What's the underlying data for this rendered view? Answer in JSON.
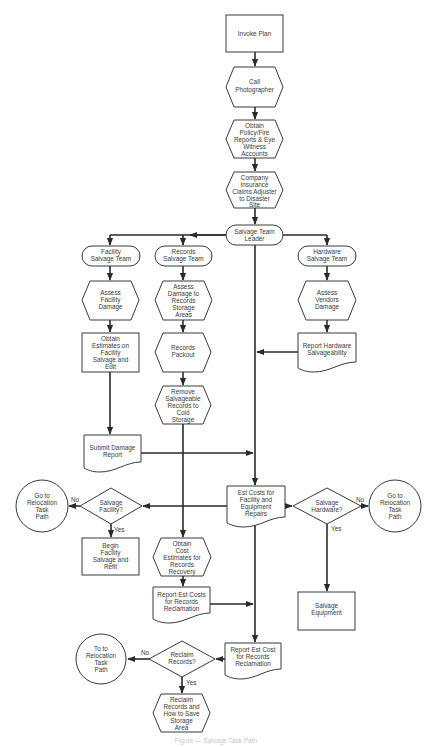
{
  "diagram": {
    "caption": "Figure — Salvage Task Path",
    "nodes": {
      "invoke_plan": [
        "Invoke Plan"
      ],
      "call_photographer": [
        "Call",
        "Photographer"
      ],
      "obtain_policy": [
        "Obtain",
        "Policy/Fire",
        "Reports & Eye",
        "Witness",
        "Accounts"
      ],
      "company_insurance": [
        "Company",
        "Insurance",
        "Claims Adjuster",
        "to Disaster",
        "Site"
      ],
      "salvage_team_leader": [
        "Salvage Team",
        "Leader"
      ],
      "facility_salvage_team": [
        "Facility",
        "Salvage Team"
      ],
      "records_salvage_team": [
        "Records",
        "Salvage Team"
      ],
      "hardware_salvage_team": [
        "Hardware",
        "Salvage Team"
      ],
      "assess_facility_damage": [
        "Assess",
        "Facility",
        "Damage"
      ],
      "assess_records_damage": [
        "Assess",
        "Damage to",
        "Records",
        "Storage",
        "Areas"
      ],
      "assess_vendors_damage": [
        "Assess",
        "Vendors",
        "Damage"
      ],
      "obtain_estimates_facility": [
        "Obtain",
        "Estimates on",
        "Facility",
        "Salvage and",
        "Edit"
      ],
      "records_packout": [
        "Records",
        "Packout"
      ],
      "report_hardware_salvageability": [
        "Report Hardware",
        "Salvageability"
      ],
      "remove_salvageable_records": [
        "Remove",
        "Salvageable",
        "Records to",
        "Cold",
        "Storage"
      ],
      "submit_damage_report": [
        "Submit Damage",
        "Report"
      ],
      "est_costs_facility_equipment": [
        "Est Costs for",
        "Facility and",
        "Equipment",
        "Repairs"
      ],
      "salvage_facility_decision": [
        "Salvage",
        "Facility?"
      ],
      "goto_relocation_left": [
        "Go to",
        "Relocation",
        "Task",
        "Path"
      ],
      "salvage_hardware_decision": [
        "Salvage",
        "Hardware?"
      ],
      "goto_relocation_right": [
        "Go to",
        "Relocation",
        "Task",
        "Path"
      ],
      "begin_facility_salvage": [
        "Begin",
        "Facility",
        "Salvage and",
        "Refit"
      ],
      "obtain_cost_estimates_records": [
        "Obtain",
        "Cost",
        "Estimates for",
        "Records",
        "Recovery"
      ],
      "report_est_costs_records": [
        "Report Est Costs",
        "for Records",
        "Reclamation"
      ],
      "salvage_equipment": [
        "Salvage",
        "Equipment"
      ],
      "report_est_cost_records_final": [
        "Report Est Cost",
        "for Records",
        "Reclamation"
      ],
      "reclaim_records_decision": [
        "Reclaim",
        "Records?"
      ],
      "goto_relocation_bottom": [
        "To to",
        "Relocation",
        "Task",
        "Path"
      ],
      "reclaim_records_save_storage": [
        "Reclaim",
        "Records and",
        "How to Save",
        "Storage",
        "Area"
      ]
    },
    "branch_labels": {
      "no": "No",
      "yes": "Yes"
    },
    "colors": {
      "stroke": "#3a3a3a",
      "line": "#2a2a2a",
      "text": "#3a3a3a",
      "background": "#ffffff"
    }
  }
}
